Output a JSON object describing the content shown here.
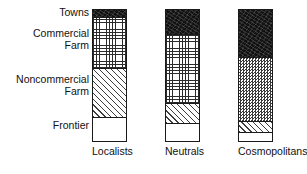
{
  "chart_data": {
    "type": "bar",
    "title": "",
    "subtitle": "",
    "xlabel": "",
    "ylabel": "",
    "stacked": true,
    "normalized": true,
    "grid": false,
    "legend_position": "left-axis-labels",
    "ylim": [
      0,
      100
    ],
    "categories": [
      "Localists",
      "Neutrals",
      "Cosmopolitans"
    ],
    "segment_names": [
      "Frontier",
      "Noncommercial Farm",
      "Commercial Farm",
      "Towns"
    ],
    "segment_order_bottom_to_top": [
      "Frontier",
      "Noncommercial Farm",
      "Commercial Farm",
      "Towns"
    ],
    "series": [
      {
        "name": "Frontier",
        "pattern": "white",
        "values": [
          18,
          14,
          7
        ]
      },
      {
        "name": "Noncommercial Farm",
        "pattern": "diagonal",
        "values": [
          38,
          15,
          8
        ]
      },
      {
        "name": "Commercial Farm",
        "pattern": "grid",
        "values": [
          39,
          53,
          49
        ]
      },
      {
        "name": "Towns",
        "pattern": "solid-black",
        "values": [
          5,
          18,
          36
        ]
      }
    ],
    "bars": [
      {
        "category": "Localists",
        "segments": [
          {
            "label": "Towns",
            "pattern": "solid-black",
            "percent": 5
          },
          {
            "label": "Commercial Farm",
            "pattern": "grid",
            "percent": 39
          },
          {
            "label": "Noncommercial Farm",
            "pattern": "diagonal",
            "percent": 38
          },
          {
            "label": "Frontier",
            "pattern": "white",
            "percent": 18
          }
        ]
      },
      {
        "category": "Neutrals",
        "segments": [
          {
            "label": "Towns",
            "pattern": "solid-black",
            "percent": 18
          },
          {
            "label": "Commercial Farm",
            "pattern": "grid",
            "percent": 53
          },
          {
            "label": "Noncommercial Farm",
            "pattern": "diagonal",
            "percent": 15
          },
          {
            "label": "Frontier",
            "pattern": "white",
            "percent": 14
          }
        ]
      },
      {
        "category": "Cosmopolitans",
        "segments": [
          {
            "label": "Towns",
            "pattern": "solid-black",
            "percent": 36
          },
          {
            "label": "Commercial Farm",
            "pattern": "checker",
            "percent": 49
          },
          {
            "label": "Noncommercial Farm",
            "pattern": "diagonal",
            "percent": 8
          },
          {
            "label": "Frontier",
            "pattern": "white",
            "percent": 7
          }
        ]
      }
    ]
  },
  "axis_labels": {
    "towns": "Towns",
    "commercial_farm": "Commercial\nFarm",
    "noncommercial_farm": "Noncommercial\nFarm",
    "frontier": "Frontier"
  },
  "series_labels": {
    "localists": "Localists",
    "neutrals": "Neutrals",
    "cosmopolitans": "Cosmopolitans"
  },
  "colors": {
    "ink": "#1a1a1a",
    "paper": "#ffffff",
    "solid_black": "#121212"
  }
}
